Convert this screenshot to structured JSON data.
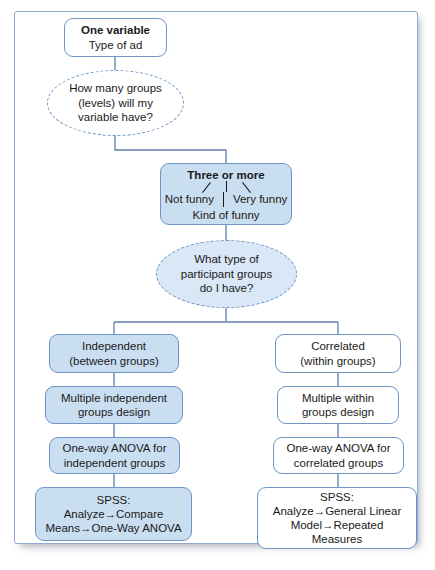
{
  "figure": {
    "type": "flowchart",
    "title_bold": "One variable"
  },
  "nodes": {
    "one_variable": {
      "title": "One variable",
      "line2": "Type of ad"
    },
    "q_groups": {
      "line1": "How many groups",
      "line2": "(levels) will my",
      "line3": "variable have?"
    },
    "three_or_more": {
      "title": "Three or more",
      "left_label": "Not funny",
      "right_label": "Very funny",
      "center_label": "Kind of funny"
    },
    "q_participants": {
      "line1": "What type of",
      "line2": "participant groups",
      "line3": "do I have?"
    },
    "independent": {
      "line1": "Independent",
      "line2": "(between groups)"
    },
    "correlated": {
      "line1": "Correlated",
      "line2": "(within groups)"
    },
    "multi_independent": {
      "line1": "Multiple independent",
      "line2": "groups design"
    },
    "multi_within": {
      "line1": "Multiple within",
      "line2": "groups design"
    },
    "anova_independent": {
      "line1": "One-way ANOVA for",
      "line2": "independent groups"
    },
    "anova_correlated": {
      "line1": "One-way ANOVA for",
      "line2": "correlated groups"
    },
    "spss_left": {
      "line1": "SPSS:",
      "line2": "Analyze→Compare",
      "line3": "Means→One-Way ANOVA"
    },
    "spss_right": {
      "line1": "SPSS:",
      "line2": "Analyze→General Linear",
      "line3": "Model→Repeated",
      "line4": "Measures"
    }
  },
  "colors": {
    "node_border": "#6e93c4",
    "node_fill_blue": "#cadef2",
    "ellipse_fill_blue": "#d9e7f6",
    "frame_border": "#8da9cf",
    "connector": "#5f7fa8",
    "text": "#1a1a1a",
    "page_background": "#ffffff"
  }
}
